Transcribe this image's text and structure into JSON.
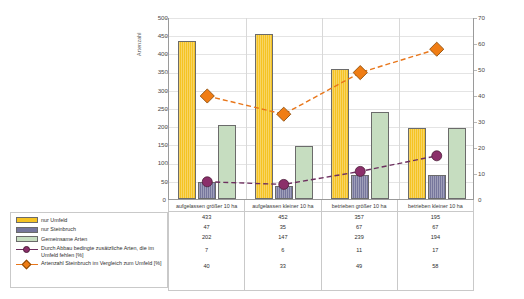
{
  "chart_data": {
    "type": "bar",
    "title": "",
    "categories": [
      "aufgelassen größer 10 ha",
      "aufgelassen kleiner 10 ha",
      "betrieben größer 10 ha",
      "betrieben kleiner 10 ha"
    ],
    "series": [
      {
        "name": "nur Umfeld",
        "type": "bar",
        "axis": "left",
        "color": "#f5c323",
        "values": [
          433,
          452,
          357,
          195
        ]
      },
      {
        "name": "nur Steinbruch",
        "type": "bar",
        "axis": "left",
        "color": "#76769c",
        "values": [
          47,
          35,
          67,
          67
        ]
      },
      {
        "name": "Gemeinsame Arten",
        "type": "bar",
        "axis": "left",
        "color": "#c6ddc0",
        "values": [
          202,
          147,
          239,
          194
        ]
      },
      {
        "name": "Durch Abbau bedingte zusätzliche Arten, die im Umfeld fehlen [%]",
        "type": "line",
        "axis": "right",
        "color": "#6d2f5f",
        "marker": "circle",
        "values": [
          7,
          6,
          11,
          17
        ]
      },
      {
        "name": "Artenzahl Steinbruch im Vergleich zum Umfeld [%]",
        "type": "line",
        "axis": "right",
        "color": "#e8761a",
        "marker": "diamond",
        "values": [
          40,
          33,
          49,
          58
        ]
      }
    ],
    "ylabel": "Artenzahl",
    "ylim": [
      0,
      500
    ],
    "yticks": [
      0,
      50,
      100,
      150,
      200,
      250,
      300,
      350,
      400,
      450,
      500
    ],
    "y2label": "",
    "y2lim": [
      0,
      70
    ],
    "y2ticks": [
      0,
      10,
      20,
      30,
      40,
      50,
      60,
      70
    ],
    "xlabel": "",
    "grid": true,
    "legend_position": "bottom-left"
  },
  "axes": {
    "left_title": "Artenzahl",
    "left_ticks": [
      "500",
      "450",
      "400",
      "350",
      "300",
      "250",
      "200",
      "150",
      "100",
      "50",
      "0"
    ],
    "right_ticks": [
      "70",
      "60",
      "50",
      "40",
      "30",
      "20",
      "10",
      "0"
    ],
    "zero_left": "0",
    "zero_right": "0"
  },
  "legend": {
    "items": [
      {
        "label": "nur Umfeld",
        "symbol": "swatch-yellow"
      },
      {
        "label": "nur Steinbruch",
        "symbol": "swatch-purple-gray"
      },
      {
        "label": "Gemeinsame Arten",
        "symbol": "swatch-green"
      },
      {
        "label": "Durch Abbau bedingte zusätzliche Arten, die im Umfeld fehlen [%]",
        "symbol": "circle-marker-purple"
      },
      {
        "label": "Artenzahl Steinbruch im Vergleich zum Umfeld [%]",
        "symbol": "diamond-marker-orange"
      }
    ]
  },
  "data_table": {
    "columns": [
      "aufgelassen größer 10 ha",
      "aufgelassen kleiner 10 ha",
      "betrieben größer 10 ha",
      "betrieben kleiner 10 ha"
    ],
    "rows": [
      {
        "name": "nur Umfeld",
        "values": [
          "433",
          "452",
          "357",
          "195"
        ]
      },
      {
        "name": "nur Steinbruch",
        "values": [
          "47",
          "35",
          "67",
          "67"
        ]
      },
      {
        "name": "Gemeinsame Arten",
        "values": [
          "202",
          "147",
          "239",
          "194"
        ]
      },
      {
        "name": "Durch Abbau bedingte zusätzliche Arten, die im Umfeld fehlen [%]",
        "values": [
          "7",
          "6",
          "11",
          "17"
        ]
      },
      {
        "name": "Artenzahl Steinbruch im Vergleich zum Umfeld [%]",
        "values": [
          "40",
          "33",
          "49",
          "58"
        ]
      }
    ]
  }
}
